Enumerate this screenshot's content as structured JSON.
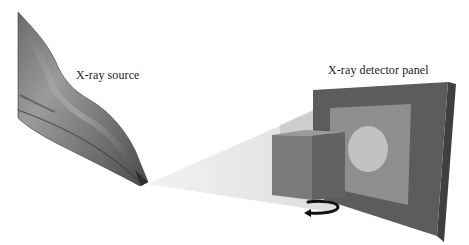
{
  "diagram": {
    "type": "x-ray imaging setup schematic",
    "labels": {
      "source": "X-ray source",
      "detector": "X-ray detector panel"
    },
    "components": [
      {
        "name": "x-ray-source",
        "description": "Metallic tapered X-ray tube nozzle emitting from its tip"
      },
      {
        "name": "x-ray-beam",
        "description": "Translucent cone beam from source tip to detector"
      },
      {
        "name": "sample-cube",
        "description": "Gray cube sample placed in beam path"
      },
      {
        "name": "detector-panel",
        "description": "Dark gray square panel with lighter inner square"
      },
      {
        "name": "projection-circle",
        "description": "Light circular projection on detector"
      },
      {
        "name": "rotation-arrow",
        "description": "Black curved arrow under cube indicating rotation"
      }
    ],
    "colors": {
      "background": "#ffffff",
      "panel_outer": "#5c5c5c",
      "panel_edge": "#474747",
      "panel_inner": "#8e8e8e",
      "projection": "#c2c2c2",
      "cube_front": "#7a7a7a",
      "cube_side": "#626262",
      "cube_top": "#9a9a9a",
      "beam": "#d8d8d8",
      "arrow": "#111111"
    }
  }
}
